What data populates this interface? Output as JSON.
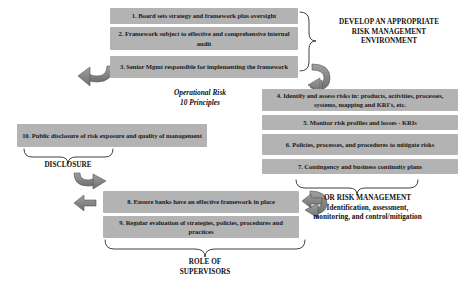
{
  "diagram": {
    "title_center": "Operational Risk\n10 Principles",
    "center_label_line1": "Operational Risk",
    "center_label_line2": "10 Principles",
    "boxes": [
      {
        "id": "principle-1",
        "text": "1. Board sets strategy and framework plus oversight"
      },
      {
        "id": "principle-2",
        "text": "2. Framework subject to effective and comprehensive internal audit"
      },
      {
        "id": "principle-3",
        "text": "3. Senior Mgmt responsible for implementing the framework"
      },
      {
        "id": "principle-4",
        "text": "4. Identify and assess risks in: products, activities, processes, systems, mapping and KRI's, etc."
      },
      {
        "id": "principle-5",
        "text": "5. Monitor risk profiles and losses - KRIs"
      },
      {
        "id": "principle-6",
        "text": "6. Policies, processes, and procedures to mitigate risks"
      },
      {
        "id": "principle-7",
        "text": "7. Contingency and business continuity plans"
      },
      {
        "id": "principle-8",
        "text": "8. Ensure banks have an effective framework in place"
      },
      {
        "id": "principle-9",
        "text": "9. Regular evaluation of strategies, policies, procedures and practices"
      },
      {
        "id": "principle-10",
        "text": "10. Public disclosure of risk exposure and quality of management"
      }
    ],
    "headings": {
      "develop_environment": "DEVELOP AN APPROPRIATE\nRISK MANAGEMENT\nENVIRONMENT",
      "develop_environment_line1": "DEVELOP AN APPROPRIATE",
      "develop_environment_line2": "RISK MANAGEMENT",
      "develop_environment_line3": "ENVIRONMENT",
      "or_risk_management_line1": "OR RISK MANAGEMENT",
      "or_risk_management_line2": "Identification, assessment,",
      "or_risk_management_line3": "monitoring, and control/mitigation",
      "disclosure": "DISCLOSURE",
      "role_of_supervisors_line1": "ROLE OF",
      "role_of_supervisors_line2": "SUPERVISORS"
    },
    "colors": {
      "box_fill": "#b3b3b3",
      "text": "#1a1a1a",
      "heading_text": "#111111",
      "brace_stroke": "#2b2b2b",
      "arrow_fill": "#8a8a8a",
      "arrow_stroke": "#4a4a4a",
      "background": "#ffffff"
    }
  }
}
